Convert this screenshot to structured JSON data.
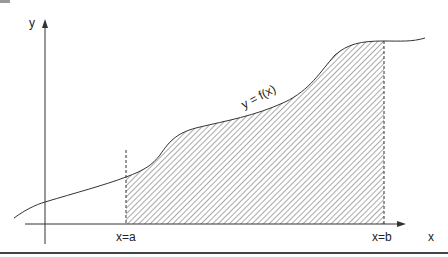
{
  "diagram": {
    "y_axis_label": "y",
    "x_axis_label": "x",
    "curve_label": "y = f(x)",
    "lower_bound_label": "x=a",
    "upper_bound_label": "x=b",
    "colors": {
      "line": "#333333",
      "hatch": "#555555",
      "background": "#ffffff",
      "bottom_rule": "#444444"
    }
  }
}
